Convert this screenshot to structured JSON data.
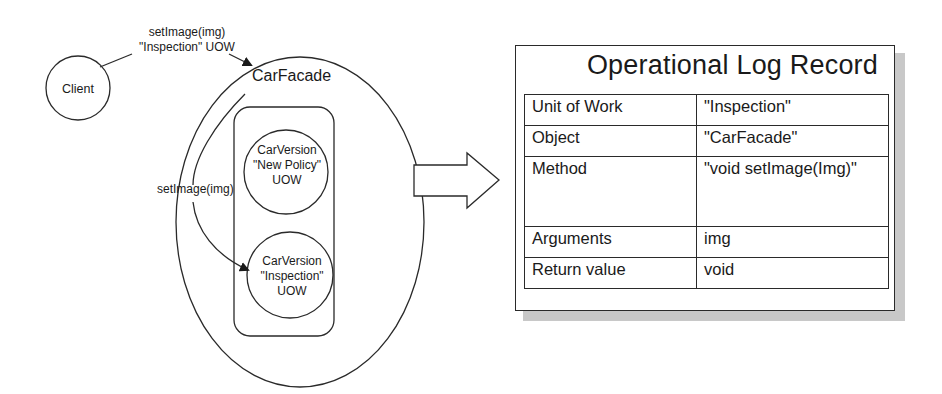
{
  "diagram": {
    "client": {
      "label": "Client"
    },
    "client_call": {
      "line1": "setImage(img)",
      "line2": "\"Inspection\" UOW"
    },
    "facade": {
      "label": "CarFacade"
    },
    "inner_call": {
      "label": "setImage(img)"
    },
    "versions": [
      {
        "line1": "CarVersion",
        "line2": "\"New Policy\"",
        "line3": "UOW"
      },
      {
        "line1": "CarVersion",
        "line2": "\"Inspection\"",
        "line3": "UOW"
      }
    ],
    "transform_arrow": {
      "icon": "hollow-right-arrow"
    }
  },
  "log_record": {
    "title": "Operational Log Record",
    "rows": [
      {
        "key": "Unit of Work",
        "value": "\"Inspection\""
      },
      {
        "key": "Object",
        "value": "\"CarFacade\""
      },
      {
        "key": "Method",
        "value": "\"void setImage(Img)\""
      },
      {
        "key": "Arguments",
        "value": "img"
      },
      {
        "key": "Return value",
        "value": "void"
      }
    ]
  },
  "colors": {
    "stroke": "#2a2a2a",
    "shadow": "#c8c8c8",
    "background": "#ffffff"
  }
}
